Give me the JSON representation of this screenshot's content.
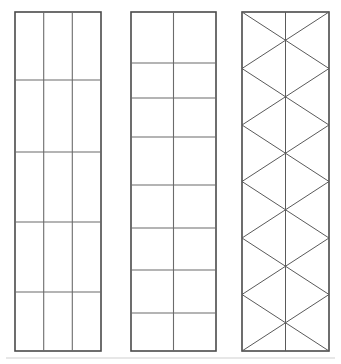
{
  "figure": {
    "background_color": "#ffffff",
    "width": 341,
    "height": 364,
    "outline_color": "#4a4a4a",
    "grid_color": "#6b6b6b",
    "brace_color": "#5a5a5a",
    "baseline_color": "#cfcfcf"
  },
  "chart_data": {
    "type": "diagram-grid",
    "panels": [
      {
        "id": "panel-1",
        "name": "three-column-grid-panel",
        "description": "Tall rectangular panel divided into 3 equal columns and 5 unequal rows",
        "x": 15,
        "y": 12,
        "width": 86,
        "height": 339,
        "columns": 3,
        "rows": 5,
        "column_x": [
          15,
          43.7,
          72.3,
          101
        ],
        "row_y": [
          12,
          80,
          152,
          222,
          292,
          351
        ],
        "row_heights": [
          68,
          72,
          70,
          70,
          59
        ],
        "braced": false
      },
      {
        "id": "panel-2",
        "name": "two-column-grid-panel",
        "description": "Tall rectangular panel divided into 2 equal columns and 8 unequal rows",
        "x": 131,
        "y": 12,
        "width": 85,
        "height": 339,
        "columns": 2,
        "rows": 8,
        "column_x": [
          131,
          173.5,
          216
        ],
        "row_y": [
          12,
          63,
          98,
          137,
          185,
          228,
          270,
          313,
          351
        ],
        "row_heights": [
          51,
          35,
          39,
          48,
          43,
          42,
          43,
          38
        ],
        "braced": false
      },
      {
        "id": "panel-3",
        "name": "x-braced-panel",
        "description": "Tall rectangular panel with vertical centerline and full-height X cross-bracing forming six stacked diamond levels",
        "x": 242,
        "y": 12,
        "width": 87,
        "height": 339,
        "columns": 1,
        "rows": 6,
        "column_x": [
          242,
          329
        ],
        "centerline_x": 285.5,
        "node_y": [
          12,
          68.5,
          125,
          181.5,
          238,
          294.5,
          351
        ],
        "row_heights": [
          56.5,
          56.5,
          56.5,
          56.5,
          56.5,
          56.5
        ],
        "braced": true,
        "brace_pattern": "X cross-bracing per level"
      }
    ],
    "baseline": {
      "y": 358,
      "x_start": 6,
      "x_end": 335,
      "visible": true
    }
  }
}
